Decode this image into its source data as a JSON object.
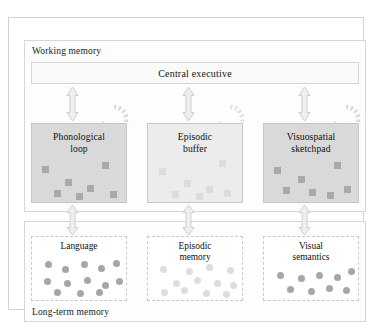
{
  "diagram": {
    "outer_frame": {
      "name": "diagram-frame"
    },
    "working_memory": {
      "label": "Working memory",
      "central_executive": {
        "label": "Central executive"
      },
      "stores": [
        {
          "id": "phonological-loop",
          "label_line1": "Phonological",
          "label_line2": "loop",
          "fill": "#d9d9d9",
          "item_shape": "square",
          "item_tone": "dark",
          "items": [
            {
              "x": 10,
              "y": 42
            },
            {
              "x": 33,
              "y": 55
            },
            {
              "x": 55,
              "y": 61
            },
            {
              "x": 70,
              "y": 38
            },
            {
              "x": 22,
              "y": 66
            },
            {
              "x": 44,
              "y": 69
            },
            {
              "x": 78,
              "y": 67
            }
          ]
        },
        {
          "id": "episodic-buffer",
          "label_line1": "Episodic",
          "label_line2": "buffer",
          "fill": "#ececec",
          "item_shape": "square",
          "item_tone": "light",
          "items": [
            {
              "x": 11,
              "y": 44
            },
            {
              "x": 36,
              "y": 56
            },
            {
              "x": 58,
              "y": 62
            },
            {
              "x": 71,
              "y": 36
            },
            {
              "x": 24,
              "y": 67
            },
            {
              "x": 48,
              "y": 69
            },
            {
              "x": 76,
              "y": 66
            }
          ]
        },
        {
          "id": "visuospatial-sketchpad",
          "label_line1": "Visuospatial",
          "label_line2": "sketchpad",
          "fill": "#d9d9d9",
          "item_shape": "square",
          "item_tone": "dark",
          "items": [
            {
              "x": 10,
              "y": 43
            },
            {
              "x": 34,
              "y": 52
            },
            {
              "x": 19,
              "y": 63
            },
            {
              "x": 45,
              "y": 65
            },
            {
              "x": 70,
              "y": 38
            },
            {
              "x": 63,
              "y": 68
            },
            {
              "x": 80,
              "y": 62
            }
          ]
        }
      ],
      "rehearsal_loops": [
        {
          "id": "rehearsal-loop-phonological"
        },
        {
          "id": "rehearsal-loop-episodic"
        },
        {
          "id": "rehearsal-loop-visuospatial"
        }
      ]
    },
    "long_term_memory": {
      "label": "Long-term memory",
      "stores": [
        {
          "id": "language",
          "label_line1": "Language",
          "label_line2": "",
          "item_shape": "circle",
          "item_tone": "dark",
          "items": [
            {
              "x": 13,
              "y": 24
            },
            {
              "x": 30,
              "y": 29
            },
            {
              "x": 49,
              "y": 24
            },
            {
              "x": 66,
              "y": 28
            },
            {
              "x": 81,
              "y": 23
            },
            {
              "x": 12,
              "y": 41
            },
            {
              "x": 32,
              "y": 43
            },
            {
              "x": 52,
              "y": 40
            },
            {
              "x": 70,
              "y": 45
            },
            {
              "x": 84,
              "y": 41
            },
            {
              "x": 22,
              "y": 52
            },
            {
              "x": 45,
              "y": 53
            },
            {
              "x": 64,
              "y": 52
            }
          ]
        },
        {
          "id": "episodic-memory",
          "label_line1": "Episodic",
          "label_line2": "memory",
          "item_shape": "circle",
          "item_tone": "light",
          "items": [
            {
              "x": 12,
              "y": 29
            },
            {
              "x": 38,
              "y": 31
            },
            {
              "x": 58,
              "y": 27
            },
            {
              "x": 79,
              "y": 30
            },
            {
              "x": 25,
              "y": 43
            },
            {
              "x": 46,
              "y": 40
            },
            {
              "x": 66,
              "y": 43
            },
            {
              "x": 82,
              "y": 45
            },
            {
              "x": 13,
              "y": 52
            },
            {
              "x": 33,
              "y": 50
            },
            {
              "x": 55,
              "y": 53
            },
            {
              "x": 75,
              "y": 54
            }
          ]
        },
        {
          "id": "visual-semantics",
          "label_line1": "Visual",
          "label_line2": "semantics",
          "item_shape": "circle",
          "item_tone": "dark",
          "items": [
            {
              "x": 13,
              "y": 35
            },
            {
              "x": 34,
              "y": 38
            },
            {
              "x": 52,
              "y": 35
            },
            {
              "x": 70,
              "y": 37
            },
            {
              "x": 84,
              "y": 31
            },
            {
              "x": 23,
              "y": 49
            },
            {
              "x": 44,
              "y": 51
            },
            {
              "x": 62,
              "y": 48
            },
            {
              "x": 79,
              "y": 50
            }
          ]
        }
      ]
    },
    "connectors": {
      "type": "double-headed-arrow",
      "top_row": [
        {
          "id": "arrow-exec-to-phonological"
        },
        {
          "id": "arrow-exec-to-episodic"
        },
        {
          "id": "arrow-exec-to-visuospatial"
        }
      ],
      "bottom_row": [
        {
          "id": "arrow-phonological-to-language"
        },
        {
          "id": "arrow-episodic-to-episodic-memory"
        },
        {
          "id": "arrow-visuospatial-to-visual-semantics"
        }
      ]
    },
    "colors": {
      "frame": "#d2d2d2",
      "panel_border": "#d6d6d6",
      "box_shaded": "#d9d9d9",
      "box_light": "#ececec",
      "item_dark": "#a9a9a9",
      "item_light": "#dcdcdc",
      "arrow_fill": "#efefef",
      "arrow_stroke": "#bdbdbd",
      "text": "#111111"
    }
  }
}
